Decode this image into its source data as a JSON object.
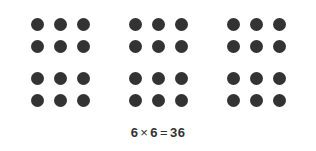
{
  "figure": {
    "type": "array-model-diagram",
    "background_color": "#ffffff",
    "dot_color": "#333333",
    "text_color": "#333333"
  },
  "array": {
    "group_rows": 2,
    "group_columns": 3,
    "total_groups": 6,
    "dots_per_group_rows": 2,
    "dots_per_group_columns": 3,
    "dots_per_group": 6,
    "total_dots": 36,
    "groups": [
      {
        "label": "group-1",
        "dots": [
          1,
          2,
          3,
          4,
          5,
          6
        ]
      },
      {
        "label": "group-2",
        "dots": [
          1,
          2,
          3,
          4,
          5,
          6
        ]
      },
      {
        "label": "group-3",
        "dots": [
          1,
          2,
          3,
          4,
          5,
          6
        ]
      },
      {
        "label": "group-4",
        "dots": [
          1,
          2,
          3,
          4,
          5,
          6
        ]
      },
      {
        "label": "group-5",
        "dots": [
          1,
          2,
          3,
          4,
          5,
          6
        ]
      },
      {
        "label": "group-6",
        "dots": [
          1,
          2,
          3,
          4,
          5,
          6
        ]
      }
    ]
  },
  "equation": {
    "full_text": "6 × 6 = 36",
    "left_factor": "6",
    "operator": "×",
    "right_factor": "6",
    "equals": "=",
    "product": "36"
  }
}
